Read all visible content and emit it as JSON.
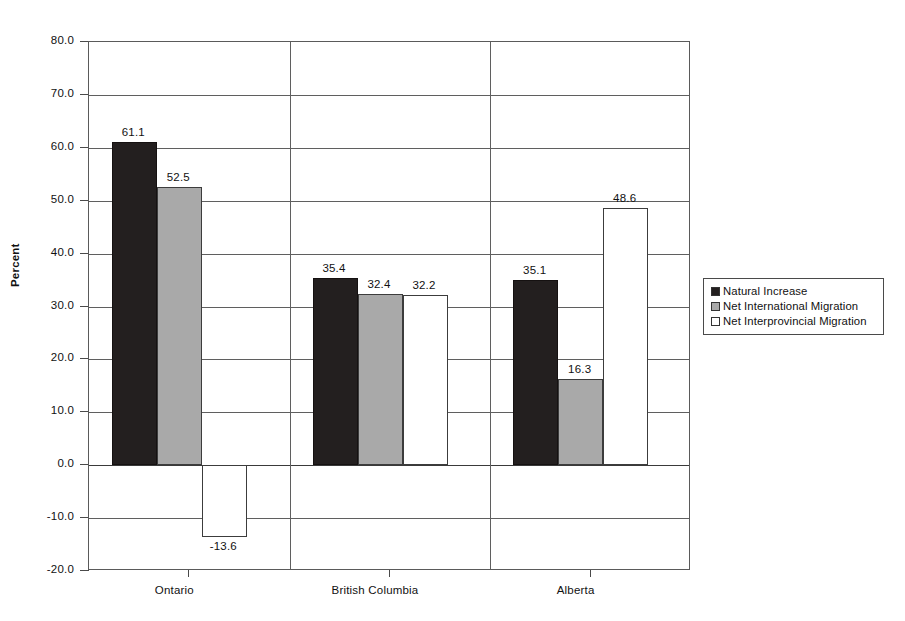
{
  "chart_data": {
    "type": "bar",
    "title": "",
    "subtitle": "",
    "xlabel": "",
    "ylabel": "Percent",
    "ylim": [
      -20.0,
      80.0
    ],
    "ytick_step": 10.0,
    "ytick_labels": [
      "80.0",
      "70.0",
      "60.0",
      "50.0",
      "40.0",
      "30.0",
      "20.0",
      "10.0",
      "0.0",
      "-10.0",
      "-20.0"
    ],
    "ytick_values": [
      80.0,
      70.0,
      60.0,
      50.0,
      40.0,
      30.0,
      20.0,
      10.0,
      0.0,
      -10.0,
      -20.0
    ],
    "grid": true,
    "grid_axis": "y",
    "legend_position": "right",
    "categories": [
      "Ontario",
      "British Columbia",
      "Alberta"
    ],
    "series": [
      {
        "name": "Natural Increase",
        "color": "#231f1f",
        "values": [
          61.1,
          35.4,
          35.1
        ],
        "labels": [
          "61.1",
          "35.4",
          "35.1"
        ]
      },
      {
        "name": "Net International Migration",
        "color": "#a9a9a9",
        "values": [
          52.5,
          32.4,
          16.3
        ],
        "labels": [
          "52.5",
          "32.4",
          "16.3"
        ]
      },
      {
        "name": "Net Interprovincial Migration",
        "color": "#ffffff",
        "values": [
          -13.6,
          32.2,
          48.6
        ],
        "labels": [
          "-13.6",
          "32.2",
          "48.6"
        ]
      }
    ]
  },
  "legend": {
    "items": [
      {
        "label": "Natural Increase"
      },
      {
        "label": "Net International Migration"
      },
      {
        "label": "Net Interprovincial Migration"
      }
    ]
  },
  "axes": {
    "y_title": "Percent"
  }
}
